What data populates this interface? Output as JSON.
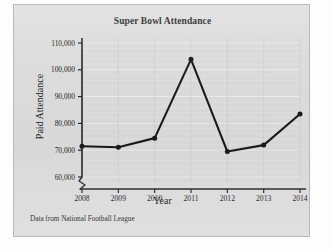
{
  "figure": {
    "title": "Super Bowl Attendance",
    "source_note": "Data from National Football League",
    "panel_bg": "#dcdcdc",
    "ink_color": "#1a1a1a"
  },
  "chart_data": {
    "type": "line",
    "title": "Super Bowl Attendance",
    "xlabel": "Year",
    "ylabel": "Paid Attendance",
    "categories": [
      "2008",
      "2009",
      "2010",
      "2011",
      "2012",
      "2013",
      "2014"
    ],
    "x": [
      2008,
      2009,
      2010,
      2011,
      2012,
      2013,
      2014
    ],
    "values": [
      71500,
      71100,
      74500,
      103900,
      69500,
      71900,
      83500
    ],
    "ylim": [
      60000,
      110000
    ],
    "xlim": [
      2008,
      2014
    ],
    "ytick_labels": [
      "60,000",
      "70,000",
      "80,000",
      "90,000",
      "100,000",
      "110,000"
    ],
    "ytick_values": [
      60000,
      70000,
      80000,
      90000,
      100000,
      110000
    ],
    "xtick_labels": [
      "2008",
      "2009",
      "2010",
      "2011",
      "2012",
      "2013",
      "2014"
    ],
    "grid": true,
    "legend": "none",
    "axis_break": true,
    "marker": "filled-circle",
    "line_color": "#1a1a1a",
    "series_name": "Paid Attendance"
  }
}
